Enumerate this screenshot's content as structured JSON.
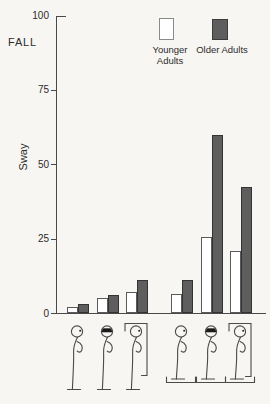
{
  "figure": {
    "fall_annotation": "FALL",
    "y_axis_label": "Sway"
  },
  "legend": {
    "younger": {
      "label": "Younger Adults",
      "color": "#ffffff"
    },
    "older": {
      "label": "Older Adults",
      "color": "#5e5e5e"
    }
  },
  "chart_data": {
    "type": "bar",
    "title": "",
    "xlabel": "",
    "ylabel": "Sway",
    "annotation": "FALL",
    "ylim": [
      0,
      100
    ],
    "yticks": [
      0,
      25,
      50,
      75,
      100
    ],
    "grid": false,
    "legend_position": "top-right",
    "categories": [
      "eyes open, fixed surface",
      "blindfolded, fixed surface",
      "visual surround box, fixed surface",
      "eyes open, movable platform",
      "blindfolded, movable platform",
      "visual surround box, movable platform"
    ],
    "series": [
      {
        "name": "Younger Adults",
        "color": "#ffffff",
        "values": [
          2,
          5,
          7,
          6.5,
          25.5,
          21
        ]
      },
      {
        "name": "Older Adults",
        "color": "#5e5e5e",
        "values": [
          3,
          6,
          11,
          11,
          60,
          42.5
        ]
      }
    ]
  },
  "conditions": [
    {
      "icon": "figure-eyes-open-floor-icon",
      "vision": "eyes-open",
      "support": "floor"
    },
    {
      "icon": "figure-blindfold-floor-icon",
      "vision": "blindfolded",
      "support": "floor"
    },
    {
      "icon": "figure-visual-box-floor-icon",
      "vision": "visual-surround",
      "support": "floor"
    },
    {
      "icon": "figure-eyes-open-platform-icon",
      "vision": "eyes-open",
      "support": "platform"
    },
    {
      "icon": "figure-blindfold-platform-icon",
      "vision": "blindfolded",
      "support": "platform"
    },
    {
      "icon": "figure-visual-box-platform-icon",
      "vision": "visual-surround",
      "support": "platform"
    }
  ]
}
